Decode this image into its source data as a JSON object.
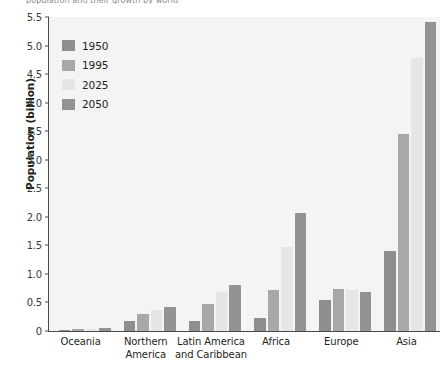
{
  "caption": {
    "text": "population and their growth by world"
  },
  "chart_data": {
    "type": "bar",
    "title": "",
    "xlabel": "",
    "ylabel": "Population (billion)",
    "ylim": [
      0,
      5.5
    ],
    "yticks": [
      "0",
      "0.5",
      "1.0",
      "1.5",
      "2.0",
      "2.5",
      "3.0",
      "3.5",
      "4.0",
      "4.5",
      "5.0",
      "5.5"
    ],
    "ytick_values": [
      0,
      0.5,
      1.0,
      1.5,
      2.0,
      2.5,
      3.0,
      3.5,
      4.0,
      4.5,
      5.0,
      5.5
    ],
    "grid": false,
    "legend_position": "upper-left-inside",
    "categories": [
      "Oceania",
      "Northern America",
      "Latin America and Caribbean",
      "Africa",
      "Europe",
      "Asia"
    ],
    "category_lines": [
      [
        "Oceania"
      ],
      [
        "Northern",
        "America"
      ],
      [
        "Latin America",
        "and Caribbean"
      ],
      [
        "Africa"
      ],
      [
        "Europe"
      ],
      [
        "Asia"
      ]
    ],
    "series": [
      {
        "name": "1950",
        "color": "#8e8e8e",
        "values": [
          0.013,
          0.17,
          0.17,
          0.23,
          0.55,
          1.4
        ]
      },
      {
        "name": "1995",
        "color": "#a8a8a8",
        "values": [
          0.028,
          0.3,
          0.48,
          0.72,
          0.73,
          3.45
        ]
      },
      {
        "name": "2025",
        "color": "#e6e6e6",
        "values": [
          0.041,
          0.37,
          0.69,
          1.47,
          0.72,
          4.79
        ]
      },
      {
        "name": "2050",
        "color": "#939393",
        "values": [
          0.046,
          0.42,
          0.81,
          2.07,
          0.68,
          5.42
        ]
      }
    ]
  },
  "colors": {
    "plot_background": "#f4f4f4",
    "axis": "#4a4a4a",
    "text": "#231f20"
  }
}
